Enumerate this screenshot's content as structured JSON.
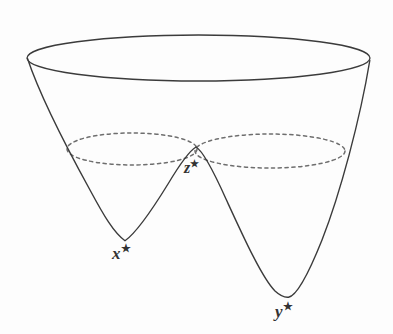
{
  "figure": {
    "kind": "double-well-energy-landscape",
    "background_color": "#fdfdfd",
    "stroke_color": "#3b3b3b",
    "dashed_stroke_color": "#6e6e6e",
    "label_color": "#333333",
    "labels": {
      "left_minimum": {
        "symbol": "x",
        "superscript": "★",
        "text": "x*"
      },
      "right_minimum": {
        "symbol": "y",
        "superscript": "★",
        "text": "y*"
      },
      "saddle_point": {
        "symbol": "z",
        "superscript": "★",
        "text": "z*"
      }
    },
    "geometry": {
      "rim_ellipse": {
        "center_x": 198,
        "center_y": 58,
        "radius_x": 172,
        "radius_y": 23
      },
      "left_lobe_ellipse": {
        "center_x": 132,
        "center_y": 149,
        "radius_x": 65,
        "radius_y": 16
      },
      "right_lobe_ellipse": {
        "center_x": 270,
        "center_y": 151,
        "radius_x": 75,
        "radius_y": 17
      },
      "left_minimum_point": {
        "x": 125,
        "y": 241
      },
      "right_minimum_point": {
        "x": 288,
        "y": 297
      },
      "saddle_point": {
        "x": 196,
        "y": 147
      },
      "rim_left_point": {
        "x": 27,
        "y": 58
      },
      "rim_right_point": {
        "x": 370,
        "y": 60
      }
    }
  }
}
